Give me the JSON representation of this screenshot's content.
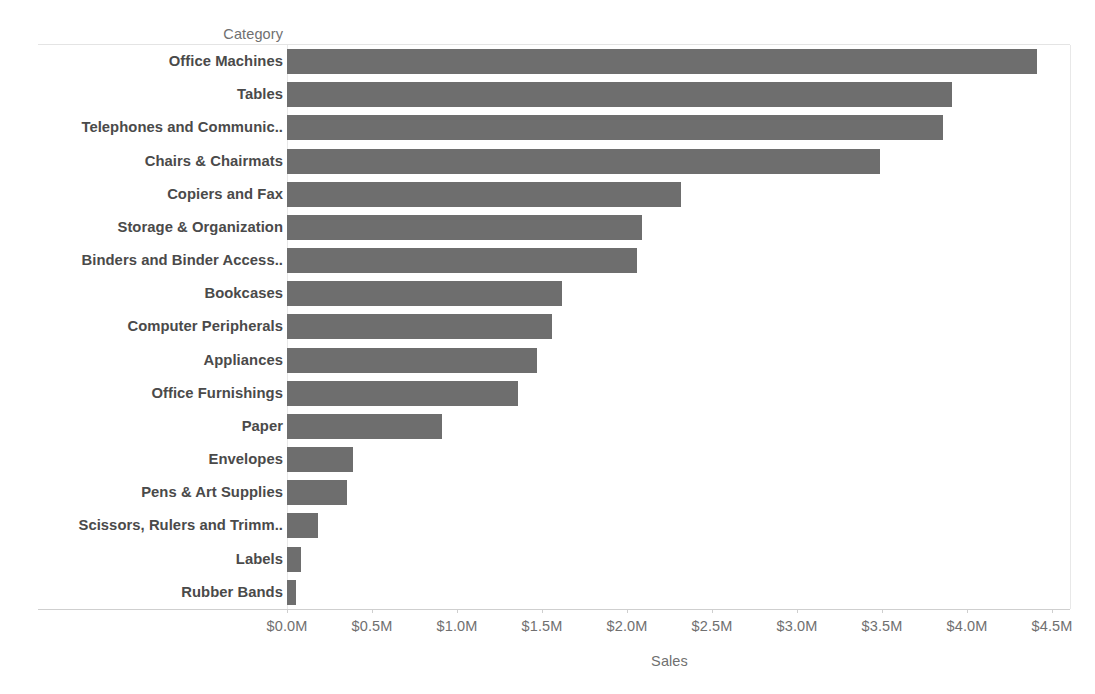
{
  "chart_data": {
    "type": "bar",
    "orientation": "horizontal",
    "title": "",
    "xlabel": "Sales",
    "ylabel": "Category",
    "grid": false,
    "legend": null,
    "xlim": [
      0,
      4.5
    ],
    "x_unit": "millions of dollars",
    "x_tick_labels": [
      "$0.0M",
      "$0.5M",
      "$1.0M",
      "$1.5M",
      "$2.0M",
      "$2.5M",
      "$3.0M",
      "$3.5M",
      "$4.0M",
      "$4.5M"
    ],
    "x_tick_values": [
      0,
      0.5,
      1.0,
      1.5,
      2.0,
      2.5,
      3.0,
      3.5,
      4.0,
      4.5
    ],
    "bar_color": "#6e6e6e",
    "categories": [
      "Office Machines",
      "Tables",
      "Telephones and Communic..",
      "Chairs & Chairmats",
      "Copiers and Fax",
      "Storage & Organization",
      "Binders and Binder Access..",
      "Bookcases",
      "Computer Peripherals",
      "Appliances",
      "Office Furnishings",
      "Paper",
      "Envelopes",
      "Pens & Art Supplies",
      "Scissors, Rulers and Trimm..",
      "Labels",
      "Rubber Bands"
    ],
    "values": [
      4.41,
      3.91,
      3.86,
      3.49,
      2.32,
      2.09,
      2.06,
      1.62,
      1.56,
      1.47,
      1.36,
      0.91,
      0.39,
      0.35,
      0.18,
      0.08,
      0.05
    ]
  },
  "axes": {
    "category_header": "Category",
    "sales_title": "Sales"
  }
}
